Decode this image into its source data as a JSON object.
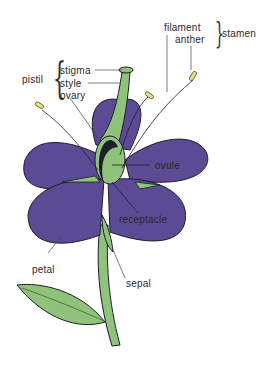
{
  "diagram": {
    "colors": {
      "petal": "#5b4a94",
      "green": "#8fc27a",
      "anther": "#e8e27a",
      "outline": "#1e1e2a"
    },
    "labels": {
      "filament": "filament",
      "anther": "anther",
      "stamen": "stamen",
      "pistil": "pistil",
      "stigma": "stigma",
      "style": "style",
      "ovary": "ovary",
      "ovule": "ovule",
      "receptacle": "receptacle",
      "petal": "petal",
      "sepal": "sepal"
    },
    "groups": {
      "stamen": [
        "filament",
        "anther"
      ],
      "pistil": [
        "stigma",
        "style",
        "ovary"
      ]
    }
  }
}
